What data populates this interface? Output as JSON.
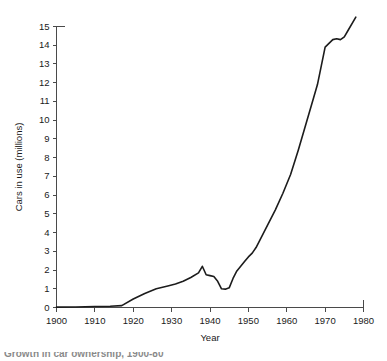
{
  "chart_data": {
    "type": "line",
    "title": "",
    "xlabel": "Year",
    "ylabel": "Cars in use (millions)",
    "xlim": [
      1900,
      1980
    ],
    "ylim": [
      0,
      15.6
    ],
    "grid": false,
    "legend": null,
    "xticks": [
      1900,
      1910,
      1920,
      1930,
      1940,
      1950,
      1960,
      1970,
      1980
    ],
    "yticks": [
      0,
      1,
      2,
      3,
      4,
      5,
      6,
      7,
      8,
      9,
      10,
      11,
      12,
      13,
      14,
      15
    ],
    "xtick_labels": [
      "1900",
      "1910",
      "1920",
      "1930",
      "1940",
      "1950",
      "1960",
      "1970",
      "1980"
    ],
    "ytick_labels": [
      "0",
      "1",
      "2",
      "3",
      "4",
      "5",
      "6",
      "7",
      "8",
      "9",
      "10",
      "11",
      "12",
      "13",
      "14",
      "15"
    ],
    "series": [
      {
        "name": "Cars in use",
        "color": "#1c1c1c",
        "x": [
          1900,
          1905,
          1910,
          1914,
          1917,
          1920,
          1923,
          1926,
          1929,
          1931,
          1933,
          1935,
          1937,
          1938,
          1939,
          1940,
          1941,
          1942,
          1943,
          1944,
          1945,
          1946,
          1947,
          1948,
          1949,
          1950,
          1951,
          1952,
          1953,
          1955,
          1957,
          1959,
          1961,
          1963,
          1965,
          1967,
          1968,
          1969,
          1970,
          1971,
          1972,
          1973,
          1974,
          1975,
          1976,
          1978
        ],
        "y": [
          0.02,
          0.03,
          0.05,
          0.07,
          0.1,
          0.45,
          0.75,
          1.0,
          1.15,
          1.25,
          1.4,
          1.6,
          1.85,
          2.2,
          1.75,
          1.7,
          1.65,
          1.4,
          1.0,
          0.98,
          1.05,
          1.55,
          1.95,
          2.2,
          2.45,
          2.7,
          2.9,
          3.2,
          3.6,
          4.4,
          5.2,
          6.1,
          7.1,
          8.4,
          9.8,
          11.2,
          11.9,
          12.9,
          13.9,
          14.1,
          14.3,
          14.35,
          14.3,
          14.45,
          14.8,
          15.5
        ]
      }
    ]
  },
  "caption": {
    "text": "Growth in car ownership, 1900-80"
  }
}
